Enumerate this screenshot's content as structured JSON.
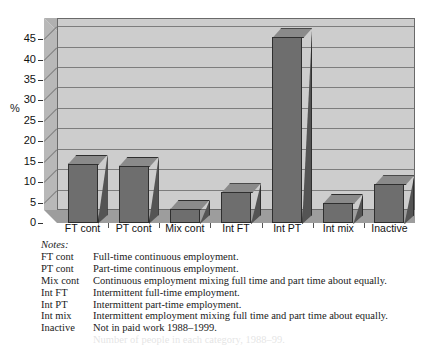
{
  "chart_data": {
    "type": "bar",
    "title": "",
    "xlabel": "",
    "ylabel": "%",
    "ylim": [
      0,
      47
    ],
    "yticks": [
      0,
      5,
      10,
      15,
      20,
      25,
      30,
      35,
      40,
      45
    ],
    "grid": true,
    "legend": "none",
    "style3d": true,
    "categories": [
      "FT cont",
      "PT cont",
      "Mix cont",
      "Int FT",
      "Int PT",
      "Int mix",
      "Inactive"
    ],
    "values": [
      14.5,
      14,
      3.5,
      7.5,
      45.5,
      5,
      9.5
    ],
    "colors": {
      "bar_front": "#6e6e6e",
      "bar_top": "#8a8a8a",
      "bar_side": "#545454",
      "plot_background": "#cdcdcd",
      "wall": "#b8b8b8",
      "floor": "#9d9d9d",
      "gridline": "#7d7d7d"
    }
  },
  "notes": {
    "title": "Notes:",
    "rows": [
      {
        "key": "FT cont",
        "text": "Full-time continuous employment."
      },
      {
        "key": "PT cont",
        "text": "Part-time continuous employment."
      },
      {
        "key": "Mix cont",
        "text": "Continuous employment mixing full time and part time about equally."
      },
      {
        "key": "Int FT",
        "text": "Intermittent full-time employment."
      },
      {
        "key": "Int PT",
        "text": "Intermittent part-time employment."
      },
      {
        "key": "Int mix",
        "text": "Intermittent employment mixing full time and part time about equally."
      },
      {
        "key": "Inactive",
        "text": "Not in paid work 1988–1999."
      }
    ]
  }
}
